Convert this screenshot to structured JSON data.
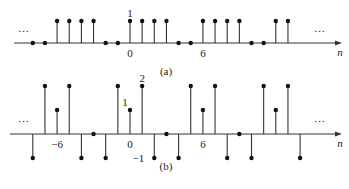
{
  "panels": [
    {
      "id": "a",
      "caption": "(a)",
      "axis_label": "n",
      "ellipsis_left": "…",
      "ellipsis_right": "…",
      "tick_labels": [
        {
          "n": 0,
          "text": "0"
        },
        {
          "n": 6,
          "text": "6"
        }
      ],
      "value_labels": [
        {
          "n": 0,
          "text": "1"
        }
      ],
      "period": 6,
      "n_start": -8,
      "values": [
        0,
        0,
        1,
        1,
        1,
        1,
        0,
        0,
        1,
        1,
        1,
        1,
        0,
        0,
        1,
        1,
        1,
        1,
        0,
        0,
        1,
        1
      ]
    },
    {
      "id": "b",
      "caption": "(b)",
      "axis_label": "n",
      "ellipsis_left": "…",
      "ellipsis_right": "…",
      "tick_labels": [
        {
          "n": -6,
          "text": "−6"
        },
        {
          "n": 0,
          "text": "0"
        },
        {
          "n": 6,
          "text": "6"
        }
      ],
      "value_labels": [
        {
          "n": 0,
          "text": "1"
        },
        {
          "n": 1,
          "text": "2"
        },
        {
          "n": 2,
          "text": "−1"
        }
      ],
      "period": 6,
      "n_start": -8,
      "values": [
        -1,
        2,
        1,
        2,
        -1,
        0,
        -1,
        2,
        1,
        2,
        -1,
        0,
        -1,
        2,
        1,
        2,
        -1,
        0,
        -1,
        2,
        1,
        2,
        -1
      ]
    }
  ],
  "chart_data": [
    {
      "type": "stem",
      "title": "(a)",
      "xlabel": "n",
      "x": [
        -8,
        -7,
        -6,
        -5,
        -4,
        -3,
        -2,
        -1,
        0,
        1,
        2,
        3,
        4,
        5,
        6,
        7,
        8,
        9,
        10,
        11,
        12,
        13
      ],
      "values": [
        0,
        0,
        1,
        1,
        1,
        1,
        0,
        0,
        1,
        1,
        1,
        1,
        0,
        0,
        1,
        1,
        1,
        1,
        0,
        0,
        1,
        1
      ],
      "periodic": true,
      "period": 6
    },
    {
      "type": "stem",
      "title": "(b)",
      "xlabel": "n",
      "x": [
        -8,
        -7,
        -6,
        -5,
        -4,
        -3,
        -2,
        -1,
        0,
        1,
        2,
        3,
        4,
        5,
        6,
        7,
        8,
        9,
        10,
        11,
        12,
        13,
        14
      ],
      "values": [
        -1,
        2,
        1,
        2,
        -1,
        0,
        -1,
        2,
        1,
        2,
        -1,
        0,
        -1,
        2,
        1,
        2,
        -1,
        0,
        -1,
        2,
        1,
        2,
        -1
      ],
      "periodic": true,
      "period": 6
    }
  ]
}
